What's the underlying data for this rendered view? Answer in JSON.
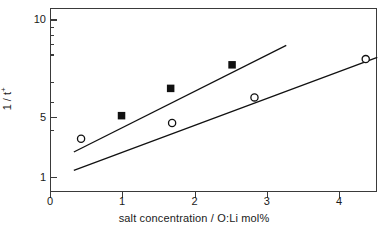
{
  "chart_data": {
    "type": "scatter",
    "title": "",
    "xlabel": "salt concentration / O:Li mol%",
    "ylabel": "1 / t+",
    "xlim": [
      0,
      4.53
    ],
    "ylim": [
      0.82,
      11.4
    ],
    "yscale": "log",
    "xscale": "linear",
    "grid": false,
    "legend": "none",
    "xticks": [
      0,
      1,
      2,
      3,
      4
    ],
    "xticklabels": [
      "0",
      "1",
      "2",
      "3",
      "4"
    ],
    "yticks": [
      1,
      5,
      10
    ],
    "yticklabels": [
      "1",
      "5",
      "10"
    ],
    "yminorticks": [
      2,
      3,
      4,
      6,
      7,
      8,
      9
    ],
    "series": [
      {
        "name": "filled-squares",
        "marker": "filled-square",
        "color": "#111111",
        "points": [
          {
            "x": 0.99,
            "y": 2.45
          },
          {
            "x": 1.67,
            "y": 3.65
          },
          {
            "x": 2.52,
            "y": 5.15
          }
        ],
        "fit_line": {
          "x0": 0.33,
          "y0": 1.44,
          "x1": 3.27,
          "y1": 6.85
        }
      },
      {
        "name": "open-circles",
        "marker": "open-circle",
        "color": "#111111",
        "points": [
          {
            "x": 0.43,
            "y": 1.75
          },
          {
            "x": 1.69,
            "y": 2.2
          },
          {
            "x": 2.83,
            "y": 3.2
          },
          {
            "x": 4.37,
            "y": 5.6
          }
        ],
        "fit_line": {
          "x0": 0.33,
          "y0": 1.1,
          "x1": 4.53,
          "y1": 5.75
        }
      }
    ]
  },
  "axes": {
    "x_axis_label": "salt concentration / O:Li mol%",
    "y_axis_label_main": "1 / t",
    "y_axis_label_sup": "+"
  }
}
